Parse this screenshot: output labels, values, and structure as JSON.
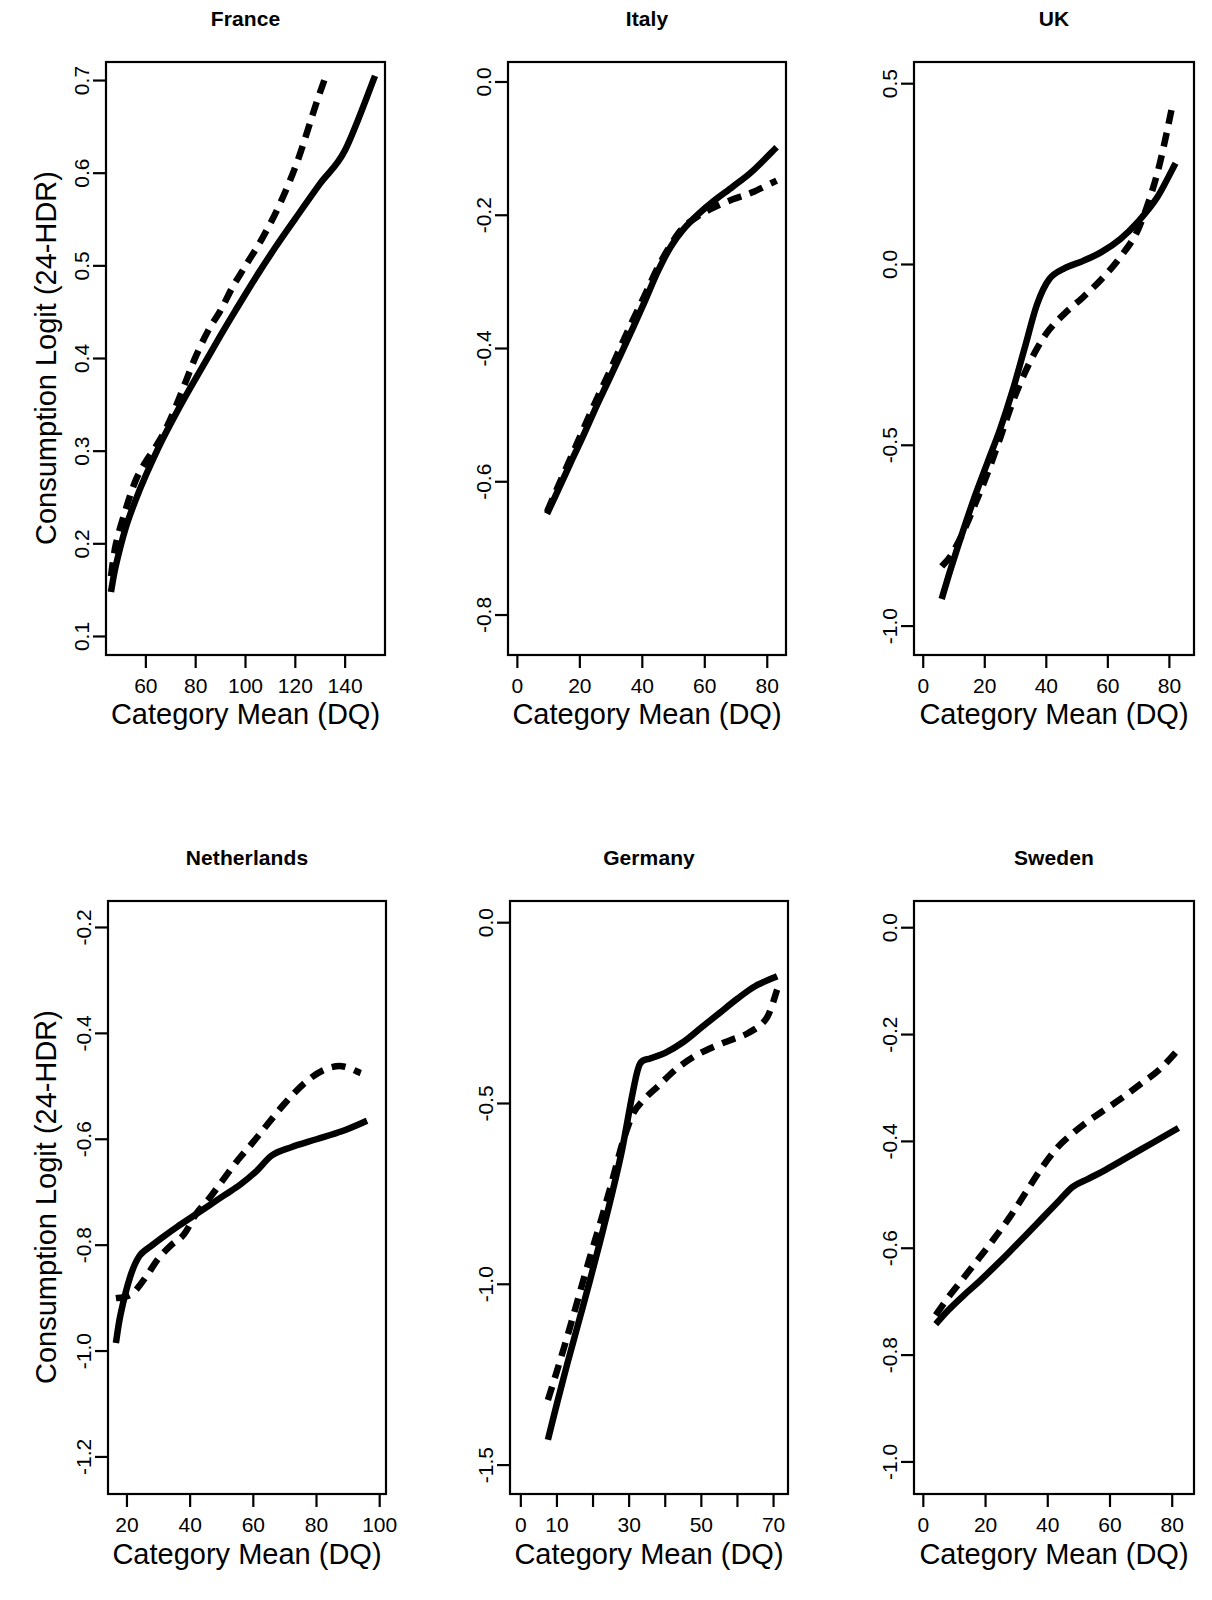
{
  "figure": {
    "background": "#ffffff",
    "foreground": "#000000",
    "y_axis_label": "Consumption Logit (24-HDR)",
    "x_axis_label": "Category Mean (DQ)",
    "layout": {
      "rows": 2,
      "cols": 3
    }
  },
  "chart_data": [
    {
      "type": "line",
      "title": "France",
      "xlabel": "Category Mean (DQ)",
      "ylabel": "Consumption Logit (24-HDR)",
      "xlim": [
        44,
        156
      ],
      "ylim": [
        0.08,
        0.72
      ],
      "xticks": [
        60,
        80,
        100,
        120,
        140
      ],
      "xtick_labels": [
        "60",
        "80",
        "100",
        "120",
        "140"
      ],
      "yticks": [
        0.1,
        0.2,
        0.3,
        0.4,
        0.5,
        0.6,
        0.7
      ],
      "ytick_labels": [
        "0.1",
        "0.2",
        "0.3",
        "0.4",
        "0.5",
        "0.6",
        "0.7"
      ],
      "grid": false,
      "legend": "none",
      "series": [
        {
          "name": "solid",
          "style": "solid",
          "x": [
            46,
            48,
            52,
            56,
            60,
            66,
            72,
            78,
            84,
            90,
            96,
            104,
            112,
            120,
            130,
            140,
            152
          ],
          "y": [
            0.148,
            0.177,
            0.218,
            0.248,
            0.274,
            0.309,
            0.34,
            0.369,
            0.397,
            0.425,
            0.452,
            0.487,
            0.52,
            0.551,
            0.589,
            0.625,
            0.705
          ]
        },
        {
          "name": "dashed",
          "style": "dashed",
          "x": [
            46,
            48,
            52,
            56,
            60,
            64,
            68,
            72,
            76,
            80,
            85,
            90,
            95,
            100,
            107,
            114,
            121,
            128,
            132
          ],
          "y": [
            0.165,
            0.2,
            0.238,
            0.269,
            0.289,
            0.305,
            0.324,
            0.348,
            0.375,
            0.402,
            0.43,
            0.452,
            0.478,
            0.5,
            0.531,
            0.568,
            0.614,
            0.672,
            0.703
          ]
        }
      ]
    },
    {
      "type": "line",
      "title": "Italy",
      "xlabel": "Category Mean (DQ)",
      "ylabel": "Consumption Logit (24-HDR)",
      "xlim": [
        -3,
        86
      ],
      "ylim": [
        -0.86,
        0.03
      ],
      "xticks": [
        0,
        20,
        40,
        60,
        80
      ],
      "xtick_labels": [
        "0",
        "20",
        "40",
        "60",
        "80"
      ],
      "yticks": [
        -0.8,
        -0.6,
        -0.4,
        -0.2,
        0.0
      ],
      "ytick_labels": [
        "-0.8",
        "-0.6",
        "-0.4",
        "-0.2",
        "0.0"
      ],
      "grid": false,
      "legend": "none",
      "series": [
        {
          "name": "solid",
          "style": "solid",
          "x": [
            9.5,
            13,
            17,
            21,
            25,
            29,
            33,
            37,
            41,
            45,
            49,
            53,
            58,
            63,
            69,
            75,
            83
          ],
          "y": [
            -0.648,
            -0.613,
            -0.572,
            -0.532,
            -0.49,
            -0.45,
            -0.41,
            -0.369,
            -0.327,
            -0.284,
            -0.248,
            -0.222,
            -0.198,
            -0.178,
            -0.157,
            -0.135,
            -0.098
          ]
        },
        {
          "name": "dashed",
          "style": "dashed",
          "x": [
            9.5,
            13,
            17,
            21,
            25,
            29,
            33,
            37,
            41,
            45,
            49,
            53,
            58,
            63,
            69,
            75,
            83
          ],
          "y": [
            -0.645,
            -0.607,
            -0.565,
            -0.522,
            -0.48,
            -0.44,
            -0.398,
            -0.357,
            -0.318,
            -0.278,
            -0.245,
            -0.219,
            -0.201,
            -0.188,
            -0.176,
            -0.166,
            -0.148
          ]
        }
      ]
    },
    {
      "type": "line",
      "title": "UK",
      "xlabel": "Category Mean (DQ)",
      "ylabel": "Consumption Logit (24-HDR)",
      "xlim": [
        -3,
        88
      ],
      "ylim": [
        -1.08,
        0.56
      ],
      "xticks": [
        0,
        20,
        40,
        60,
        80
      ],
      "xtick_labels": [
        "0",
        "20",
        "40",
        "60",
        "80"
      ],
      "yticks": [
        -1.0,
        -0.5,
        0.0,
        0.5
      ],
      "ytick_labels": [
        "-1.0",
        "-0.5",
        "0.0",
        "0.5"
      ],
      "grid": false,
      "legend": "none",
      "series": [
        {
          "name": "solid",
          "style": "solid",
          "x": [
            6,
            9,
            13,
            17,
            21,
            25,
            29,
            33,
            37,
            41,
            46,
            52,
            58,
            64,
            70,
            76,
            82
          ],
          "y": [
            -0.925,
            -0.84,
            -0.735,
            -0.636,
            -0.545,
            -0.455,
            -0.35,
            -0.23,
            -0.11,
            -0.04,
            -0.01,
            0.01,
            0.035,
            0.07,
            0.12,
            0.185,
            0.28
          ]
        },
        {
          "name": "dashed",
          "style": "dashed",
          "x": [
            6,
            9,
            13,
            17,
            21,
            25,
            29,
            33,
            37,
            41,
            46,
            52,
            58,
            64,
            70,
            76,
            81
          ],
          "y": [
            -0.835,
            -0.805,
            -0.74,
            -0.66,
            -0.575,
            -0.48,
            -0.382,
            -0.3,
            -0.232,
            -0.18,
            -0.135,
            -0.09,
            -0.04,
            0.02,
            0.1,
            0.25,
            0.44
          ]
        }
      ]
    },
    {
      "type": "line",
      "title": "Netherlands",
      "xlabel": "Category Mean (DQ)",
      "ylabel": "Consumption Logit (24-HDR)",
      "xlim": [
        14,
        102
      ],
      "ylim": [
        -1.27,
        -0.15
      ],
      "xticks": [
        20,
        40,
        60,
        80,
        100
      ],
      "xtick_labels": [
        "20",
        "40",
        "60",
        "80",
        "100"
      ],
      "yticks": [
        -1.2,
        -1.0,
        -0.8,
        -0.6,
        -0.4,
        -0.2
      ],
      "ytick_labels": [
        "-1.2",
        "-1.0",
        "-0.8",
        "-0.6",
        "-0.4",
        "-0.2"
      ],
      "grid": false,
      "legend": "none",
      "series": [
        {
          "name": "solid",
          "style": "solid",
          "x": [
            16.5,
            18,
            21,
            24,
            28,
            32,
            36,
            41,
            46,
            51,
            56,
            61,
            66,
            72,
            80,
            88,
            96
          ],
          "y": [
            -0.985,
            -0.93,
            -0.86,
            -0.82,
            -0.8,
            -0.782,
            -0.765,
            -0.745,
            -0.725,
            -0.705,
            -0.685,
            -0.66,
            -0.63,
            -0.615,
            -0.6,
            -0.585,
            -0.565
          ]
        },
        {
          "name": "dashed",
          "style": "dashed",
          "x": [
            16.5,
            19,
            22,
            26,
            30,
            34,
            38,
            42,
            46,
            50,
            55,
            60,
            65,
            70,
            76,
            82,
            88,
            94
          ],
          "y": [
            -0.9,
            -0.898,
            -0.89,
            -0.86,
            -0.825,
            -0.8,
            -0.78,
            -0.74,
            -0.712,
            -0.68,
            -0.64,
            -0.605,
            -0.568,
            -0.532,
            -0.495,
            -0.47,
            -0.462,
            -0.475
          ]
        }
      ]
    },
    {
      "type": "line",
      "title": "Germany",
      "xlabel": "Category Mean (DQ)",
      "ylabel": "Consumption Logit (24-HDR)",
      "xlim": [
        -3,
        74
      ],
      "ylim": [
        -1.58,
        0.06
      ],
      "xticks": [
        0,
        10,
        20,
        30,
        40,
        50,
        60,
        70
      ],
      "xtick_labels": [
        "0",
        "10",
        "",
        "30",
        "",
        "50",
        "",
        "70"
      ],
      "yticks": [
        -1.5,
        -1.0,
        -0.5,
        0.0
      ],
      "ytick_labels": [
        "-1.5",
        "-1.0",
        "-0.5",
        "0.0"
      ],
      "grid": false,
      "legend": "none",
      "series": [
        {
          "name": "solid",
          "style": "solid",
          "x": [
            7.5,
            10,
            13,
            16,
            19,
            22,
            25,
            28,
            31,
            33,
            36,
            40,
            45,
            50,
            55,
            60,
            65,
            71
          ],
          "y": [
            -1.43,
            -1.33,
            -1.215,
            -1.105,
            -0.995,
            -0.88,
            -0.76,
            -0.63,
            -0.47,
            -0.39,
            -0.375,
            -0.36,
            -0.33,
            -0.29,
            -0.25,
            -0.21,
            -0.175,
            -0.148
          ]
        },
        {
          "name": "dashed",
          "style": "dashed",
          "x": [
            7.5,
            10,
            13,
            16,
            19,
            22,
            25,
            28,
            31,
            34,
            38,
            43,
            48,
            53,
            58,
            63,
            68,
            71
          ],
          "y": [
            -1.32,
            -1.24,
            -1.14,
            -1.035,
            -0.93,
            -0.83,
            -0.725,
            -0.615,
            -0.53,
            -0.49,
            -0.452,
            -0.405,
            -0.37,
            -0.345,
            -0.325,
            -0.305,
            -0.265,
            -0.185
          ]
        }
      ]
    },
    {
      "type": "line",
      "title": "Sweden",
      "xlabel": "Category Mean (DQ)",
      "ylabel": "Consumption Logit (24-HDR)",
      "xlim": [
        -3,
        87
      ],
      "ylim": [
        -1.06,
        0.05
      ],
      "xticks": [
        0,
        20,
        40,
        60,
        80
      ],
      "xtick_labels": [
        "0",
        "20",
        "40",
        "60",
        "80"
      ],
      "yticks": [
        -1.0,
        -0.8,
        -0.6,
        -0.4,
        -0.2,
        0.0
      ],
      "ytick_labels": [
        "-1.0",
        "-0.8",
        "-0.6",
        "-0.4",
        "-0.2",
        "0.0"
      ],
      "grid": false,
      "legend": "none",
      "series": [
        {
          "name": "solid",
          "style": "solid",
          "x": [
            4,
            8,
            13,
            18,
            23,
            28,
            33,
            38,
            43,
            48,
            53,
            58,
            64,
            70,
            76,
            82
          ],
          "y": [
            -0.742,
            -0.716,
            -0.688,
            -0.662,
            -0.634,
            -0.605,
            -0.575,
            -0.545,
            -0.515,
            -0.485,
            -0.47,
            -0.455,
            -0.435,
            -0.415,
            -0.395,
            -0.375
          ]
        },
        {
          "name": "dashed",
          "style": "dashed",
          "x": [
            4,
            8,
            13,
            18,
            23,
            28,
            33,
            38,
            43,
            48,
            53,
            58,
            64,
            70,
            76,
            82
          ],
          "y": [
            -0.725,
            -0.692,
            -0.655,
            -0.618,
            -0.58,
            -0.54,
            -0.495,
            -0.45,
            -0.412,
            -0.385,
            -0.362,
            -0.342,
            -0.318,
            -0.292,
            -0.265,
            -0.228
          ]
        }
      ]
    }
  ],
  "panels": [
    {
      "title": "France",
      "box": {
        "x": 106,
        "y": 62,
        "w": 279,
        "h": 593
      },
      "title_y": 8,
      "xlabel_y": 700,
      "show_ylabel": true,
      "ylabel_x": 32,
      "ylabel_center_y": 358
    },
    {
      "title": "Italy",
      "box": {
        "x": 508,
        "y": 62,
        "w": 278,
        "h": 593
      },
      "title_y": 8,
      "xlabel_y": 700,
      "show_ylabel": false,
      "ylabel_x": 0,
      "ylabel_center_y": 0
    },
    {
      "title": "UK",
      "box": {
        "x": 914,
        "y": 62,
        "w": 280,
        "h": 593
      },
      "title_y": 8,
      "xlabel_y": 700,
      "show_ylabel": false,
      "ylabel_x": 0,
      "ylabel_center_y": 0
    },
    {
      "title": "Netherlands",
      "box": {
        "x": 108,
        "y": 901,
        "w": 278,
        "h": 593
      },
      "title_y": 847,
      "xlabel_y": 1540,
      "show_ylabel": true,
      "ylabel_x": 32,
      "ylabel_center_y": 1197
    },
    {
      "title": "Germany",
      "box": {
        "x": 510,
        "y": 901,
        "w": 278,
        "h": 593
      },
      "title_y": 847,
      "xlabel_y": 1540,
      "show_ylabel": false,
      "ylabel_x": 0,
      "ylabel_center_y": 0
    },
    {
      "title": "Sweden",
      "box": {
        "x": 914,
        "y": 901,
        "w": 280,
        "h": 593
      },
      "title_y": 847,
      "xlabel_y": 1540,
      "show_ylabel": false,
      "ylabel_x": 0,
      "ylabel_center_y": 0
    }
  ]
}
